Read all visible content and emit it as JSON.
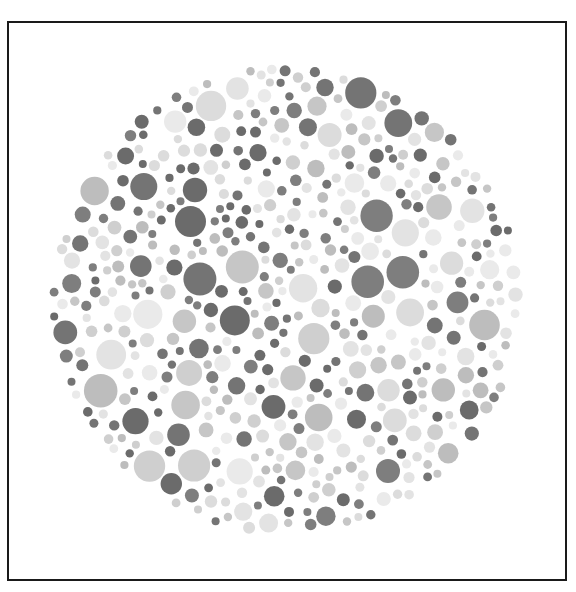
{
  "figure": {
    "kind": "pseudo-isochromatic color plate (grayscale reproduction)",
    "frame": {
      "x": 7,
      "y": 21,
      "width": 560,
      "height": 561,
      "border_color": "#1a1a1a",
      "border_width": 2
    },
    "plate": {
      "cx": 286,
      "cy": 300,
      "r": 237
    },
    "palette": {
      "dark": [
        "#6b6b6b",
        "#747474",
        "#7e7e7e"
      ],
      "medium": [
        "#bdbdbd",
        "#c6c6c6",
        "#cfcfcf"
      ],
      "light": [
        "#dcdcdc",
        "#e3e3e3",
        "#eaeaea"
      ]
    },
    "mix": {
      "dark": 0.36,
      "medium": 0.28,
      "light": 0.36
    },
    "dot_radius": {
      "min": 4,
      "max": 17
    },
    "seed": 20240607,
    "attempts": 9000
  }
}
